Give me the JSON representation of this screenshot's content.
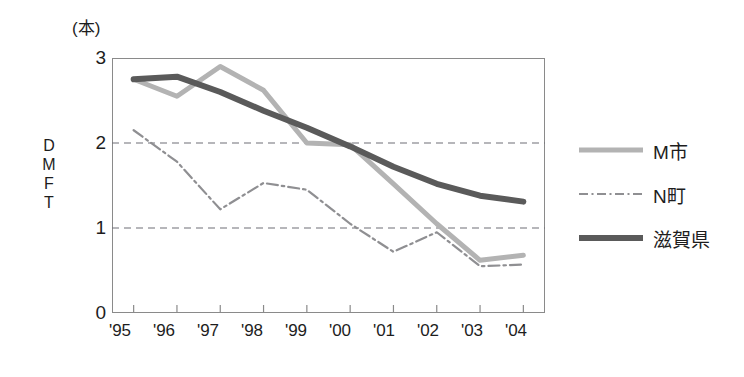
{
  "chart_data": {
    "type": "line",
    "title": "",
    "subtitle": "",
    "unit_label": "(本)",
    "ylabel": "DMFT",
    "ylabel_chars": [
      "D",
      "M",
      "F",
      "T"
    ],
    "xlabel": "",
    "categories": [
      "'95",
      "'96",
      "'97",
      "'98",
      "'99",
      "'00",
      "'01",
      "'02",
      "'03",
      "'04"
    ],
    "x": [
      "'95",
      "'96",
      "'97",
      "'98",
      "'99",
      "'00",
      "'01",
      "'02",
      "'03",
      "'04"
    ],
    "ylim": [
      0,
      3
    ],
    "yticks": [
      0,
      1,
      2,
      3
    ],
    "ytick_labels": [
      "0",
      "1",
      "2",
      "3"
    ],
    "gridlines": [
      1,
      2
    ],
    "grid": true,
    "grid_style": "dashed",
    "legend_position": "right",
    "series": [
      {
        "name": "M市",
        "style": "solid",
        "color": "#b3b3b3",
        "width": 5,
        "values": [
          2.75,
          2.55,
          2.9,
          2.62,
          2.0,
          1.98,
          1.52,
          1.05,
          0.62,
          0.68
        ]
      },
      {
        "name": "N町",
        "style": "dash-dot",
        "color": "#8f8f92",
        "width": 2.2,
        "values": [
          2.15,
          1.78,
          1.22,
          1.53,
          1.45,
          1.05,
          0.72,
          0.95,
          0.55,
          0.57
        ]
      },
      {
        "name": "滋賀県",
        "style": "solid",
        "color": "#5a5a5a",
        "width": 6,
        "values": [
          2.75,
          2.78,
          2.6,
          2.38,
          2.18,
          1.96,
          1.72,
          1.52,
          1.38,
          1.31
        ]
      }
    ]
  },
  "legend": {
    "items": [
      {
        "label": "M市",
        "color": "#b3b3b3",
        "style": "solid"
      },
      {
        "label": "N町",
        "color": "#8f8f92",
        "style": "dash-dot"
      },
      {
        "label": "滋賀県",
        "color": "#5a5a5a",
        "style": "solid"
      }
    ]
  },
  "axes": {
    "y_unit": "(本)",
    "y_title": "DMFT",
    "y_tick_0": "0",
    "y_tick_1": "1",
    "y_tick_2": "2",
    "y_tick_3": "3",
    "y_char_0": "D",
    "y_char_1": "M",
    "y_char_2": "F",
    "y_char_3": "T",
    "x_tick_0": "'95",
    "x_tick_1": "'96",
    "x_tick_2": "'97",
    "x_tick_3": "'98",
    "x_tick_4": "'99",
    "x_tick_5": "'00",
    "x_tick_6": "'01",
    "x_tick_7": "'02",
    "x_tick_8": "'03",
    "x_tick_9": "'04"
  },
  "colors": {
    "m_city": "#b3b3b3",
    "n_town": "#8f8f92",
    "prefecture": "#5a5a5a",
    "axis": "#8a8a8a",
    "grid": "#6e6e76",
    "text": "#1d1d1d"
  }
}
